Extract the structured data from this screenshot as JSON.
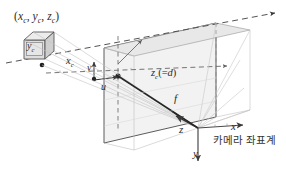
{
  "figure": {
    "title": "",
    "labels": {
      "point_3d": "(xc, yc, zc)",
      "cube_face": "yc",
      "axis_xc": "xc",
      "image_u": "u",
      "image_v": "v",
      "depth_zc": "zc(=d)",
      "focal_length": "f",
      "camera_x": "x",
      "camera_y": "y",
      "camera_z": "z",
      "camera_frame_caption": "카메라 좌표계"
    },
    "colors": {
      "stroke_dark": "#3a3a3a",
      "stroke_mid": "#6e6e6e",
      "stroke_light": "#b9b9b9",
      "plane_fill": "#f2f2f2",
      "plane_fill_top": "#e9e9e9",
      "cube_fill": "#e3e3e3",
      "cube_face_fill": "#d8d8d8",
      "background": "#ffffff",
      "text": "#2b2b2b"
    },
    "icon_names": [
      "dashed-arrow-icon",
      "solid-arrow-icon",
      "projection-ray-icon",
      "image-plane-icon",
      "cube-icon",
      "axis-arrow-icon",
      "principal-point-icon"
    ]
  }
}
